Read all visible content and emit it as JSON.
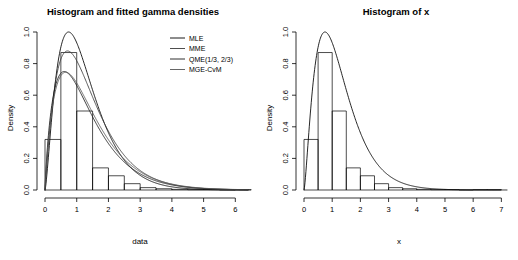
{
  "chart_data": [
    {
      "type": "histogram",
      "panel": "left",
      "title": "Histogram and fitted gamma densities",
      "xlabel": "data",
      "ylabel": "Density",
      "xlim": [
        0,
        6.4
      ],
      "ylim": [
        0,
        1.0
      ],
      "xticks": [
        0,
        1,
        2,
        3,
        4,
        5,
        6
      ],
      "xtick_labels": [
        "0",
        "1",
        "2",
        "3",
        "4",
        "5",
        "6"
      ],
      "yticks": [
        0.0,
        0.2,
        0.4,
        0.6,
        0.8,
        1.0
      ],
      "ytick_labels": [
        "0.0",
        "0.2",
        "0.4",
        "0.6",
        "0.8",
        "1.0"
      ],
      "grid": false,
      "bin_width": 0.5,
      "bin_edges": [
        0.0,
        0.5,
        1.0,
        1.5,
        2.0,
        2.5,
        3.0,
        3.5,
        4.0,
        4.5,
        5.0,
        5.5,
        6.0,
        6.5
      ],
      "bin_heights": [
        0.32,
        0.87,
        0.5,
        0.14,
        0.09,
        0.04,
        0.015,
        0.008,
        0.004,
        0.002,
        0.002,
        0.0,
        0.002
      ],
      "legend_position": "top-right",
      "series": [
        {
          "name": "MLE",
          "color": "#000000",
          "peak_x": 0.78,
          "peak_y": 1.0,
          "shape": 2.45,
          "rate": 1.95
        },
        {
          "name": "MME",
          "color": "#3a3a3a",
          "peak_x": 0.74,
          "peak_y": 0.88,
          "shape": 2.1,
          "rate": 1.55
        },
        {
          "name": "QME(1/3, 2/3)",
          "color": "#1a1a1a",
          "peak_x": 0.62,
          "peak_y": 0.75,
          "shape": 1.85,
          "rate": 1.4
        },
        {
          "name": "MGE-CvM",
          "color": "#555555",
          "peak_x": 0.66,
          "peak_y": 0.745,
          "shape": 1.9,
          "rate": 1.38
        }
      ]
    },
    {
      "type": "histogram",
      "panel": "right",
      "title": "Histogram of x",
      "xlabel": "x",
      "ylabel": "Density",
      "xlim": [
        0,
        7.2
      ],
      "ylim": [
        0,
        1.0
      ],
      "xticks": [
        0,
        1,
        2,
        3,
        4,
        5,
        6,
        7
      ],
      "xtick_labels": [
        "0",
        "1",
        "2",
        "3",
        "4",
        "5",
        "6",
        "7"
      ],
      "yticks": [
        0.0,
        0.2,
        0.4,
        0.6,
        0.8,
        1.0
      ],
      "ytick_labels": [
        "0.0",
        "0.2",
        "0.4",
        "0.6",
        "0.8",
        "1.0"
      ],
      "grid": false,
      "bin_width": 0.5,
      "bin_edges": [
        0.0,
        0.5,
        1.0,
        1.5,
        2.0,
        2.5,
        3.0,
        3.5,
        4.0,
        4.5,
        5.0,
        5.5,
        6.0,
        6.5,
        7.0
      ],
      "bin_heights": [
        0.32,
        0.87,
        0.5,
        0.14,
        0.09,
        0.04,
        0.015,
        0.008,
        0.004,
        0.002,
        0.002,
        0.0,
        0.002,
        0.002
      ],
      "legend_position": "none",
      "series": [
        {
          "name": "density",
          "color": "#000000",
          "peak_x": 0.78,
          "peak_y": 1.0,
          "shape": 2.45,
          "rate": 1.95
        }
      ]
    }
  ]
}
